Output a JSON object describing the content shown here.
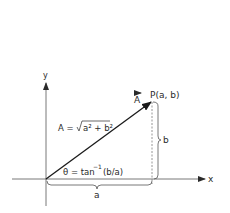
{
  "diagram": {
    "axes": {
      "x_label": "x",
      "y_label": "y"
    },
    "point": {
      "label": "P(a, b)"
    },
    "vector": {
      "name": "A",
      "magnitude_prefix": "A = ",
      "magnitude_radicand": "a² + b²"
    },
    "angle": {
      "prefix": "θ = tan",
      "superscript": "−1",
      "argument": "(b/a)"
    },
    "components": {
      "horizontal": "a",
      "vertical": "b"
    },
    "colors": {
      "line": "#2a2a2a",
      "dashed": "#8a8a8a",
      "background": "#ffffff"
    }
  }
}
